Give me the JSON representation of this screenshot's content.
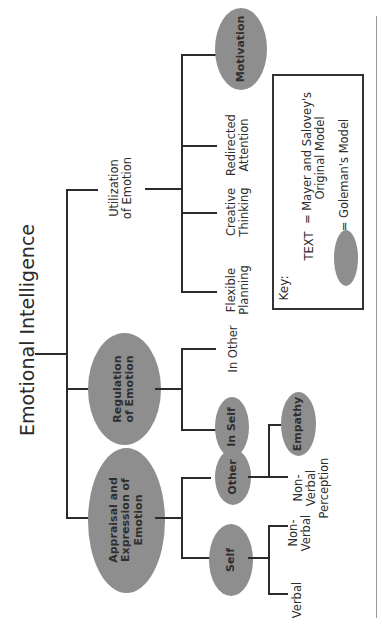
{
  "title": "Emotional Intelligence",
  "branches": {
    "appraisal": {
      "label": "Appraisal and\nExpression of\nEmotion",
      "children": {
        "self": {
          "label": "Self",
          "children": [
            "Verbal",
            "Non-\nVerbal"
          ]
        },
        "other": {
          "label": "Other",
          "children": [
            "Non-\nVerbal\nPerception",
            "Empathy"
          ]
        }
      }
    },
    "regulation": {
      "label": "Regulation\nof Emotion",
      "children": [
        "In Self",
        "In Other"
      ]
    },
    "utilization": {
      "label": "Utilization\nof Emotion",
      "children": [
        "Flexible\nPlanning",
        "Creative\nThinking",
        "Redirected\nAttention",
        "Motivation"
      ]
    }
  },
  "key": {
    "heading": "Key:",
    "text_sample": "TEXT",
    "text_meaning": "= Mayer and Salovey's\nOriginal Model",
    "ellipse_meaning": "= Goleman's Model"
  },
  "colors": {
    "ellipse_fill": "#8e8e8e",
    "line": "#2b2b2b"
  }
}
